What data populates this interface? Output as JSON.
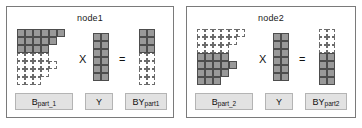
{
  "figure": {
    "caption_absent": true,
    "colors": {
      "cell_on_fill": "#999999",
      "cell_on_border": "#4d4d4d",
      "cell_off_fill": "#ffffff",
      "cell_off_border": "#6b6b6b",
      "panel_border": "#7a7a7a",
      "tag_fill": "#e2e2e2",
      "tag_border": "#b4b4b4",
      "text": "#111111",
      "background": "#ffffff"
    },
    "legend_meaning": {
      "solid_gray_cell": "block owned by this node",
      "dashed_empty_cell": "block owned by the other node"
    }
  },
  "panels": [
    {
      "id": "node1",
      "title": "node1",
      "operands": {
        "b": {
          "label_base": "B",
          "label_sub": "part_1",
          "rows": 7,
          "cols": 6,
          "grid": [
            [
              1,
              1,
              1,
              1,
              1,
              1
            ],
            [
              1,
              1,
              1,
              1,
              1,
              0
            ],
            [
              1,
              1,
              1,
              1,
              0,
              0
            ],
            [
              2,
              2,
              2,
              2,
              0,
              0
            ],
            [
              2,
              2,
              2,
              2,
              2,
              0
            ],
            [
              2,
              2,
              2,
              2,
              0,
              0
            ],
            [
              2,
              2,
              2,
              0,
              0,
              0
            ]
          ]
        },
        "y": {
          "label_base": "Y",
          "label_sub": "",
          "rows": 6,
          "cols": 2,
          "grid": [
            [
              1,
              1
            ],
            [
              1,
              1
            ],
            [
              1,
              1
            ],
            [
              1,
              1
            ],
            [
              1,
              1
            ],
            [
              1,
              1
            ]
          ]
        },
        "by": {
          "label_base": "BY",
          "label_sub": "part1",
          "rows": 7,
          "cols": 2,
          "grid": [
            [
              1,
              1
            ],
            [
              1,
              1
            ],
            [
              1,
              1
            ],
            [
              2,
              2
            ],
            [
              2,
              2
            ],
            [
              2,
              2
            ],
            [
              2,
              2
            ]
          ]
        }
      },
      "operators": {
        "multiply": "X",
        "equals": "="
      }
    },
    {
      "id": "node2",
      "title": "node2",
      "operands": {
        "b": {
          "label_base": "B",
          "label_sub": "part_2",
          "rows": 7,
          "cols": 6,
          "grid": [
            [
              2,
              2,
              2,
              2,
              2,
              2
            ],
            [
              2,
              2,
              2,
              2,
              2,
              0
            ],
            [
              2,
              2,
              2,
              2,
              0,
              0
            ],
            [
              1,
              1,
              1,
              1,
              0,
              0
            ],
            [
              1,
              1,
              1,
              1,
              1,
              0
            ],
            [
              1,
              1,
              1,
              1,
              0,
              0
            ],
            [
              1,
              1,
              1,
              0,
              0,
              0
            ]
          ]
        },
        "y": {
          "label_base": "Y",
          "label_sub": "",
          "rows": 6,
          "cols": 2,
          "grid": [
            [
              1,
              1
            ],
            [
              1,
              1
            ],
            [
              1,
              1
            ],
            [
              1,
              1
            ],
            [
              1,
              1
            ],
            [
              1,
              1
            ]
          ]
        },
        "by": {
          "label_base": "BY",
          "label_sub": "part2",
          "rows": 7,
          "cols": 2,
          "grid": [
            [
              2,
              2
            ],
            [
              2,
              2
            ],
            [
              2,
              2
            ],
            [
              1,
              1
            ],
            [
              1,
              1
            ],
            [
              1,
              1
            ],
            [
              1,
              1
            ]
          ]
        }
      },
      "operators": {
        "multiply": "X",
        "equals": "="
      }
    }
  ]
}
